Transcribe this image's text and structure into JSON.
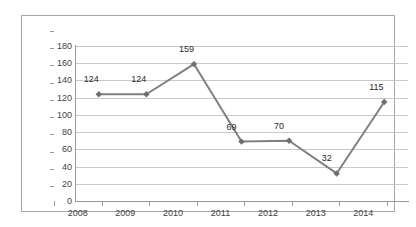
{
  "chart_data": {
    "type": "line",
    "title": "",
    "xlabel": "",
    "ylabel": "",
    "categories": [
      "2008",
      "2009",
      "2010",
      "2011",
      "2012",
      "2013",
      "2014"
    ],
    "values": [
      124,
      124,
      159,
      69,
      70,
      32,
      115
    ],
    "series": [
      {
        "name": "Series 1",
        "values": [
          124,
          124,
          159,
          69,
          70,
          32,
          115
        ]
      }
    ],
    "data_labels": [
      "124",
      "124",
      "159",
      "69",
      "70",
      "32",
      "115"
    ],
    "ylim": [
      0,
      180
    ],
    "y_ticks": [
      0,
      20,
      40,
      60,
      80,
      100,
      120,
      140,
      160,
      180
    ],
    "y_tick_labels": [
      "0",
      "20",
      "40",
      "60",
      "80",
      "100",
      "120",
      "140",
      "160",
      "180"
    ],
    "grid": "horizontal",
    "legend": "none",
    "marker": "diamond",
    "colors": {
      "line": "#808080",
      "marker": "#6e6e6e",
      "gridline": "#c9c9c9",
      "axis": "#9a9a9a",
      "frame": "#a6a6a6",
      "text": "#3f3f3f",
      "label_text": "#2b2b2b",
      "background": "#ffffff"
    }
  }
}
